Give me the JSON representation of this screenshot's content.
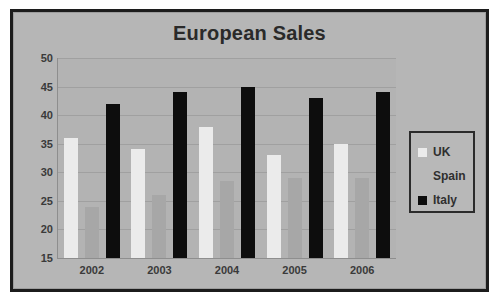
{
  "chart_data": {
    "type": "bar",
    "title": "European Sales",
    "xlabel": "",
    "ylabel": "",
    "categories": [
      "2002",
      "2003",
      "2004",
      "2005",
      "2006"
    ],
    "series": [
      {
        "name": "UK",
        "color": "#ebebeb",
        "values": [
          36,
          34,
          38,
          33,
          35
        ]
      },
      {
        "name": "Spain",
        "color": "#a7a7a7",
        "values": [
          24,
          26,
          28.5,
          29,
          29
        ]
      },
      {
        "name": "Italy",
        "color": "#0d0d0d",
        "values": [
          42,
          44,
          45,
          43,
          44
        ]
      }
    ],
    "ylim": [
      15,
      50
    ],
    "yticks": [
      50,
      45,
      40,
      35,
      30,
      25,
      20,
      15
    ],
    "ytick_labels": [
      "50",
      "45",
      "40",
      "35",
      "30",
      "25",
      "20",
      "15"
    ],
    "grid": true,
    "legend_position": "right"
  },
  "legend": {
    "items": [
      {
        "label": "UK"
      },
      {
        "label": "Spain"
      },
      {
        "label": "Italy"
      }
    ]
  },
  "colors": {
    "plot_background": "#b3b3b3",
    "plate_background": "#b6b6b6",
    "frame_border": "#1c1c1c",
    "gridline": "#a0a0a0",
    "text": "#2f2f2f"
  }
}
